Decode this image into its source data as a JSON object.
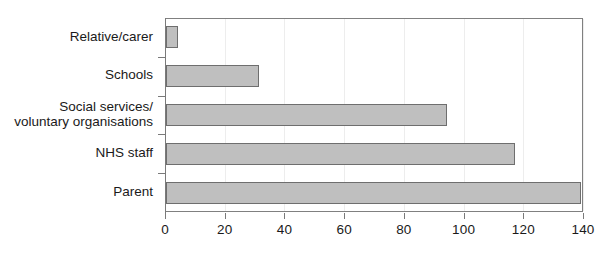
{
  "chart_data": {
    "type": "bar",
    "orientation": "horizontal",
    "title": "",
    "subtitle": "",
    "xlabel": "",
    "ylabel": "",
    "categories": [
      "Relative/carer",
      "Schools",
      "Social services/\nvoluntary organisations",
      "NHS staff",
      "Parent"
    ],
    "category_lines": [
      [
        "Relative/carer"
      ],
      [
        "Schools"
      ],
      [
        "Social services/",
        "voluntary organisations"
      ],
      [
        "NHS staff"
      ],
      [
        "Parent"
      ]
    ],
    "values": [
      4,
      31,
      94,
      117,
      139
    ],
    "series": [
      {
        "name": "Referral source",
        "values": [
          4,
          31,
          94,
          117,
          139
        ]
      }
    ],
    "xlim": [
      0,
      140
    ],
    "xticks": [
      0,
      20,
      40,
      60,
      80,
      100,
      120,
      140
    ],
    "xtick_labels": [
      "0",
      "20",
      "40",
      "60",
      "80",
      "100",
      "120",
      "140"
    ],
    "grid": "vertical-only",
    "legend": "none",
    "annotations": [],
    "colors": {
      "bar_fill": "#bfbfbf",
      "bar_border": "#6e6e6e",
      "axis": "#7a7a7a",
      "gridline": "#ededed",
      "text": "#1a1a1a",
      "background": "#ffffff"
    }
  }
}
